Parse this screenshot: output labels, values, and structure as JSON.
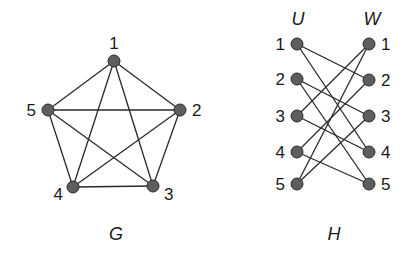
{
  "graph_g": {
    "caption": "G",
    "nodes": [
      {
        "id": "1",
        "label": "1",
        "x": 114,
        "y": 61,
        "lx": 114,
        "ly": 49,
        "anchor": "middle"
      },
      {
        "id": "2",
        "label": "2",
        "x": 180,
        "y": 110,
        "lx": 192,
        "ly": 116,
        "anchor": "start"
      },
      {
        "id": "3",
        "label": "3",
        "x": 153,
        "y": 186,
        "lx": 164,
        "ly": 200,
        "anchor": "start"
      },
      {
        "id": "4",
        "label": "4",
        "x": 73,
        "y": 187,
        "lx": 63,
        "ly": 200,
        "anchor": "end"
      },
      {
        "id": "5",
        "label": "5",
        "x": 48,
        "y": 110,
        "lx": 36,
        "ly": 116,
        "anchor": "end"
      }
    ],
    "edges": [
      [
        "1",
        "2"
      ],
      [
        "1",
        "3"
      ],
      [
        "1",
        "4"
      ],
      [
        "1",
        "5"
      ],
      [
        "2",
        "3"
      ],
      [
        "2",
        "4"
      ],
      [
        "2",
        "5"
      ],
      [
        "3",
        "4"
      ],
      [
        "3",
        "5"
      ],
      [
        "4",
        "5"
      ]
    ],
    "caption_pos": {
      "x": 116,
      "y": 240
    }
  },
  "graph_h": {
    "caption": "H",
    "part_u_label": "U",
    "part_w_label": "W",
    "u_nodes": [
      {
        "id": "u1",
        "label": "1",
        "x": 297,
        "y": 44
      },
      {
        "id": "u2",
        "label": "2",
        "x": 297,
        "y": 79
      },
      {
        "id": "u3",
        "label": "3",
        "x": 297,
        "y": 116
      },
      {
        "id": "u4",
        "label": "4",
        "x": 297,
        "y": 152
      },
      {
        "id": "u5",
        "label": "5",
        "x": 297,
        "y": 184
      }
    ],
    "w_nodes": [
      {
        "id": "w1",
        "label": "1",
        "x": 369,
        "y": 44
      },
      {
        "id": "w2",
        "label": "2",
        "x": 369,
        "y": 80
      },
      {
        "id": "w3",
        "label": "3",
        "x": 369,
        "y": 116
      },
      {
        "id": "w4",
        "label": "4",
        "x": 369,
        "y": 152
      },
      {
        "id": "w5",
        "label": "5",
        "x": 369,
        "y": 184
      }
    ],
    "edges": [
      [
        "u1",
        "w2"
      ],
      [
        "u1",
        "w4"
      ],
      [
        "u2",
        "w3"
      ],
      [
        "u2",
        "w5"
      ],
      [
        "u3",
        "w1"
      ],
      [
        "u3",
        "w4"
      ],
      [
        "u4",
        "w2"
      ],
      [
        "u4",
        "w5"
      ],
      [
        "u5",
        "w1"
      ],
      [
        "u5",
        "w3"
      ]
    ],
    "caption_pos": {
      "x": 334,
      "y": 240
    }
  }
}
